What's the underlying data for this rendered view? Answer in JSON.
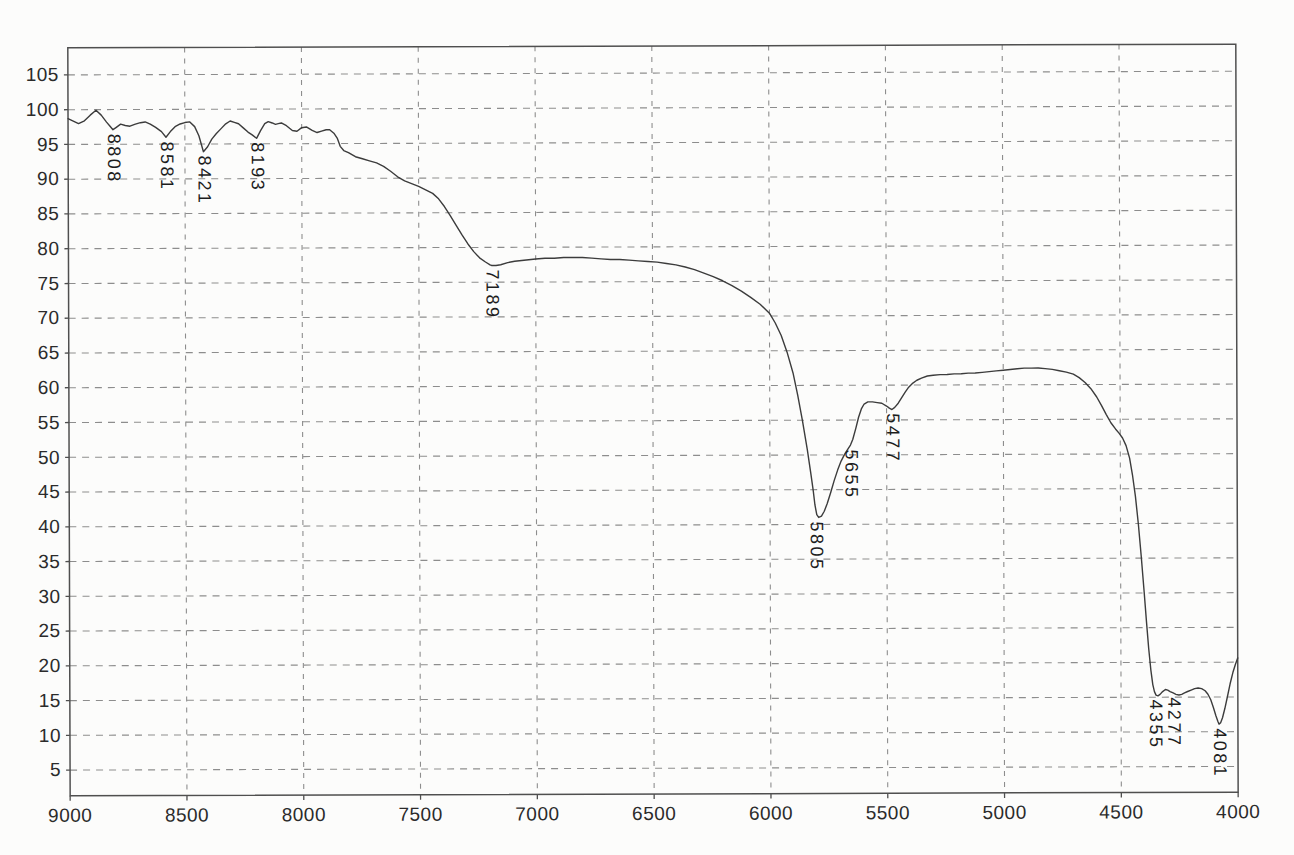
{
  "page": {
    "background": "#fcfcfb"
  },
  "chart_data": {
    "type": "line",
    "title": "",
    "xlabel": "",
    "ylabel": "",
    "xlim": [
      9000,
      4000
    ],
    "ylim": [
      1.3,
      108.9
    ],
    "x_ticks": [
      9000,
      8500,
      8000,
      7500,
      7000,
      6500,
      6000,
      5500,
      5000,
      4500,
      4000
    ],
    "y_ticks": [
      5,
      10,
      15,
      20,
      25,
      30,
      35,
      40,
      45,
      50,
      55,
      60,
      65,
      70,
      75,
      80,
      85,
      90,
      95,
      100,
      105
    ],
    "grid": "dashed",
    "legend": "none",
    "colors": {
      "line": "#3c3c3c",
      "grid": "#8d8d8d",
      "frame": "#4f4f4f",
      "tick": "#4f4f4f",
      "text": "#2b2b2b"
    },
    "peak_labels": [
      {
        "text": "8808",
        "x": 8808,
        "y": 97.1
      },
      {
        "text": "8581",
        "x": 8581,
        "y": 96.0
      },
      {
        "text": "8421",
        "x": 8421,
        "y": 93.9
      },
      {
        "text": "8193",
        "x": 8193,
        "y": 95.8
      },
      {
        "text": "7189",
        "x": 7189,
        "y": 77.4
      },
      {
        "text": "5805",
        "x": 5805,
        "y": 41.0
      },
      {
        "text": "5655",
        "x": 5655,
        "y": 51.4
      },
      {
        "text": "5477",
        "x": 5477,
        "y": 56.5
      },
      {
        "text": "4355",
        "x": 4355,
        "y": 15.3
      },
      {
        "text": "4277",
        "x": 4277,
        "y": 15.6
      },
      {
        "text": "4081",
        "x": 4081,
        "y": 11.1
      }
    ],
    "series": [
      {
        "name": "transmittance-trace",
        "points": [
          [
            9000,
            98.7
          ],
          [
            8980,
            98.4
          ],
          [
            8955,
            98.0
          ],
          [
            8930,
            98.4
          ],
          [
            8905,
            99.2
          ],
          [
            8880,
            99.9
          ],
          [
            8858,
            99.2
          ],
          [
            8835,
            98.2
          ],
          [
            8820,
            97.6
          ],
          [
            8808,
            97.1
          ],
          [
            8795,
            97.4
          ],
          [
            8775,
            97.9
          ],
          [
            8755,
            97.7
          ],
          [
            8735,
            97.6
          ],
          [
            8712,
            97.9
          ],
          [
            8690,
            98.1
          ],
          [
            8670,
            98.2
          ],
          [
            8648,
            97.9
          ],
          [
            8625,
            97.4
          ],
          [
            8600,
            96.8
          ],
          [
            8581,
            96.0
          ],
          [
            8562,
            96.8
          ],
          [
            8542,
            97.5
          ],
          [
            8520,
            97.9
          ],
          [
            8500,
            98.1
          ],
          [
            8480,
            98.2
          ],
          [
            8458,
            97.5
          ],
          [
            8440,
            96.2
          ],
          [
            8421,
            93.9
          ],
          [
            8403,
            94.6
          ],
          [
            8385,
            95.7
          ],
          [
            8365,
            96.5
          ],
          [
            8345,
            97.2
          ],
          [
            8325,
            97.9
          ],
          [
            8306,
            98.3
          ],
          [
            8288,
            98.1
          ],
          [
            8270,
            97.9
          ],
          [
            8250,
            97.3
          ],
          [
            8230,
            96.7
          ],
          [
            8212,
            96.3
          ],
          [
            8193,
            95.8
          ],
          [
            8176,
            96.9
          ],
          [
            8158,
            97.9
          ],
          [
            8143,
            98.2
          ],
          [
            8126,
            98.0
          ],
          [
            8112,
            97.8
          ],
          [
            8100,
            97.9
          ],
          [
            8087,
            98.0
          ],
          [
            8065,
            97.6
          ],
          [
            8040,
            96.9
          ],
          [
            8020,
            96.8
          ],
          [
            8000,
            97.3
          ],
          [
            7980,
            97.4
          ],
          [
            7955,
            96.9
          ],
          [
            7934,
            96.6
          ],
          [
            7915,
            96.8
          ],
          [
            7895,
            97.0
          ],
          [
            7880,
            97.0
          ],
          [
            7862,
            96.5
          ],
          [
            7848,
            95.8
          ],
          [
            7835,
            94.6
          ],
          [
            7820,
            94.0
          ],
          [
            7800,
            93.7
          ],
          [
            7770,
            93.1
          ],
          [
            7740,
            92.8
          ],
          [
            7710,
            92.5
          ],
          [
            7680,
            92.2
          ],
          [
            7650,
            91.7
          ],
          [
            7620,
            91.0
          ],
          [
            7590,
            90.2
          ],
          [
            7560,
            89.6
          ],
          [
            7530,
            89.2
          ],
          [
            7500,
            88.8
          ],
          [
            7470,
            88.3
          ],
          [
            7440,
            87.8
          ],
          [
            7415,
            87.0
          ],
          [
            7390,
            85.9
          ],
          [
            7365,
            84.6
          ],
          [
            7340,
            83.2
          ],
          [
            7315,
            81.8
          ],
          [
            7290,
            80.5
          ],
          [
            7265,
            79.4
          ],
          [
            7240,
            78.5
          ],
          [
            7215,
            77.9
          ],
          [
            7195,
            77.5
          ],
          [
            7189,
            77.4
          ],
          [
            7170,
            77.4
          ],
          [
            7150,
            77.5
          ],
          [
            7120,
            77.8
          ],
          [
            7090,
            78.0
          ],
          [
            7060,
            78.1
          ],
          [
            7030,
            78.2
          ],
          [
            7000,
            78.3
          ],
          [
            6960,
            78.4
          ],
          [
            6920,
            78.4
          ],
          [
            6880,
            78.5
          ],
          [
            6840,
            78.5
          ],
          [
            6800,
            78.5
          ],
          [
            6760,
            78.4
          ],
          [
            6720,
            78.3
          ],
          [
            6680,
            78.2
          ],
          [
            6640,
            78.2
          ],
          [
            6600,
            78.1
          ],
          [
            6560,
            78.0
          ],
          [
            6520,
            77.9
          ],
          [
            6480,
            77.8
          ],
          [
            6440,
            77.6
          ],
          [
            6400,
            77.4
          ],
          [
            6360,
            77.1
          ],
          [
            6320,
            76.7
          ],
          [
            6280,
            76.2
          ],
          [
            6240,
            75.7
          ],
          [
            6200,
            75.1
          ],
          [
            6160,
            74.4
          ],
          [
            6120,
            73.6
          ],
          [
            6080,
            72.7
          ],
          [
            6040,
            71.7
          ],
          [
            6000,
            70.4
          ],
          [
            5975,
            69.0
          ],
          [
            5950,
            67.2
          ],
          [
            5925,
            64.8
          ],
          [
            5900,
            61.8
          ],
          [
            5880,
            58.6
          ],
          [
            5860,
            54.9
          ],
          [
            5840,
            50.8
          ],
          [
            5825,
            47.3
          ],
          [
            5815,
            44.9
          ],
          [
            5808,
            42.8
          ],
          [
            5800,
            41.4
          ],
          [
            5792,
            41.0
          ],
          [
            5780,
            41.2
          ],
          [
            5768,
            41.9
          ],
          [
            5755,
            43.0
          ],
          [
            5740,
            44.6
          ],
          [
            5725,
            46.3
          ],
          [
            5710,
            47.8
          ],
          [
            5695,
            49.1
          ],
          [
            5680,
            50.1
          ],
          [
            5665,
            50.9
          ],
          [
            5655,
            51.4
          ],
          [
            5645,
            52.2
          ],
          [
            5632,
            53.8
          ],
          [
            5620,
            55.4
          ],
          [
            5608,
            56.6
          ],
          [
            5596,
            57.3
          ],
          [
            5580,
            57.6
          ],
          [
            5560,
            57.6
          ],
          [
            5540,
            57.5
          ],
          [
            5520,
            57.4
          ],
          [
            5500,
            57.0
          ],
          [
            5488,
            56.7
          ],
          [
            5477,
            56.5
          ],
          [
            5465,
            56.8
          ],
          [
            5450,
            57.4
          ],
          [
            5435,
            58.2
          ],
          [
            5420,
            59.0
          ],
          [
            5405,
            59.7
          ],
          [
            5390,
            60.2
          ],
          [
            5370,
            60.7
          ],
          [
            5350,
            61.0
          ],
          [
            5325,
            61.3
          ],
          [
            5300,
            61.4
          ],
          [
            5270,
            61.5
          ],
          [
            5240,
            61.5
          ],
          [
            5210,
            61.6
          ],
          [
            5180,
            61.6
          ],
          [
            5150,
            61.7
          ],
          [
            5120,
            61.7
          ],
          [
            5090,
            61.8
          ],
          [
            5060,
            61.9
          ],
          [
            5030,
            62.0
          ],
          [
            5000,
            62.1
          ],
          [
            4970,
            62.2
          ],
          [
            4940,
            62.3
          ],
          [
            4910,
            62.4
          ],
          [
            4880,
            62.4
          ],
          [
            4850,
            62.4
          ],
          [
            4820,
            62.3
          ],
          [
            4790,
            62.2
          ],
          [
            4760,
            62.0
          ],
          [
            4730,
            61.8
          ],
          [
            4700,
            61.5
          ],
          [
            4675,
            61.0
          ],
          [
            4650,
            60.3
          ],
          [
            4625,
            59.4
          ],
          [
            4600,
            58.2
          ],
          [
            4580,
            57.0
          ],
          [
            4560,
            55.7
          ],
          [
            4540,
            54.5
          ],
          [
            4520,
            53.6
          ],
          [
            4505,
            53.0
          ],
          [
            4490,
            52.3
          ],
          [
            4475,
            51.2
          ],
          [
            4460,
            49.4
          ],
          [
            4448,
            47.0
          ],
          [
            4436,
            43.9
          ],
          [
            4424,
            40.0
          ],
          [
            4412,
            35.3
          ],
          [
            4400,
            30.2
          ],
          [
            4390,
            25.8
          ],
          [
            4381,
            22.0
          ],
          [
            4372,
            18.9
          ],
          [
            4364,
            16.8
          ],
          [
            4357,
            15.8
          ],
          [
            4350,
            15.3
          ],
          [
            4342,
            15.2
          ],
          [
            4333,
            15.4
          ],
          [
            4322,
            15.8
          ],
          [
            4310,
            16.1
          ],
          [
            4300,
            16.0
          ],
          [
            4290,
            15.8
          ],
          [
            4277,
            15.6
          ],
          [
            4265,
            15.4
          ],
          [
            4252,
            15.3
          ],
          [
            4240,
            15.4
          ],
          [
            4228,
            15.6
          ],
          [
            4215,
            15.8
          ],
          [
            4200,
            16.0
          ],
          [
            4185,
            16.2
          ],
          [
            4170,
            16.3
          ],
          [
            4155,
            16.2
          ],
          [
            4140,
            15.9
          ],
          [
            4128,
            15.4
          ],
          [
            4116,
            14.6
          ],
          [
            4105,
            13.5
          ],
          [
            4094,
            12.3
          ],
          [
            4086,
            11.5
          ],
          [
            4081,
            11.1
          ],
          [
            4074,
            11.3
          ],
          [
            4066,
            12.0
          ],
          [
            4056,
            13.3
          ],
          [
            4045,
            15.0
          ],
          [
            4033,
            16.9
          ],
          [
            4021,
            18.5
          ],
          [
            4010,
            19.7
          ],
          [
            4000,
            20.6
          ]
        ]
      }
    ]
  }
}
